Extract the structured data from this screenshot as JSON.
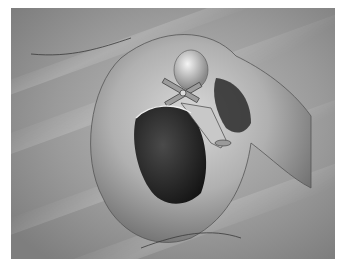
{
  "image": {
    "kind": "medical-illustration",
    "style": "grayscale pencil rendering",
    "subject": "surgical view of ear structure with prosthesis in cavity",
    "colors": {
      "background": "#8c8c8c",
      "highlight": "#e6e6e6",
      "shadow": "#2a2a2a",
      "page": "#ffffff"
    }
  }
}
